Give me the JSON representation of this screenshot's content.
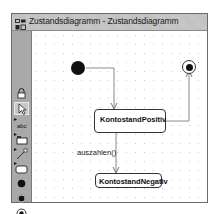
{
  "window": {
    "title": "Zustandsdiagramm - Zustandsdiagramm",
    "icon": "diagram-app-icon"
  },
  "palette": {
    "tools": [
      {
        "name": "lock-icon",
        "label": "lock"
      },
      {
        "name": "select-pointer-icon",
        "label": "select"
      },
      {
        "name": "text-tool-icon",
        "label": "abc"
      },
      {
        "name": "package-tool-icon",
        "label": "package"
      },
      {
        "name": "transition-tool-icon",
        "label": "transition"
      },
      {
        "name": "state-tool-icon",
        "label": "state"
      },
      {
        "name": "initial-state-tool-icon",
        "label": "initial state"
      },
      {
        "name": "fork-state-tool-icon",
        "label": "pseudo state"
      },
      {
        "name": "final-state-tool-icon",
        "label": "final state"
      }
    ]
  },
  "diagram": {
    "states": [
      {
        "id": "positiv",
        "label": "KontostandPositiv"
      },
      {
        "id": "negativ",
        "label": "KontostandNegativ"
      }
    ],
    "transitions": [
      {
        "from": "initial",
        "to": "positiv",
        "label": ""
      },
      {
        "from": "positiv",
        "to": "final",
        "label": ""
      },
      {
        "from": "positiv",
        "to": "negativ",
        "label": "auszahlen()"
      }
    ],
    "colors": {
      "line": "#8a8a8a",
      "node": "#111111"
    }
  }
}
